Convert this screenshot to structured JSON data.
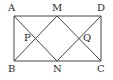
{
  "diagram": {
    "type": "geometry",
    "shape": "rectangle",
    "stroke_color": "#444444",
    "points": {
      "A": {
        "label": "A",
        "x": 14,
        "y": 16,
        "lx": 8,
        "ly": 11
      },
      "M": {
        "label": "M",
        "x": 57,
        "y": 16,
        "lx": 52,
        "ly": 11
      },
      "D": {
        "label": "D",
        "x": 101,
        "y": 16,
        "lx": 97,
        "ly": 11
      },
      "B": {
        "label": "B",
        "x": 14,
        "y": 61,
        "lx": 8,
        "ly": 72
      },
      "N": {
        "label": "N",
        "x": 57,
        "y": 61,
        "lx": 53,
        "ly": 72
      },
      "C": {
        "label": "C",
        "x": 101,
        "y": 61,
        "lx": 97,
        "ly": 72
      },
      "P": {
        "label": "P",
        "x": 36,
        "y": 38,
        "lx": 24,
        "ly": 41
      },
      "Q": {
        "label": "Q",
        "x": 79,
        "y": 38,
        "lx": 83,
        "ly": 41
      }
    },
    "segments": [
      [
        "A",
        "D"
      ],
      [
        "D",
        "C"
      ],
      [
        "C",
        "B"
      ],
      [
        "B",
        "A"
      ],
      [
        "A",
        "N"
      ],
      [
        "B",
        "M"
      ],
      [
        "M",
        "C"
      ],
      [
        "N",
        "D"
      ]
    ]
  }
}
